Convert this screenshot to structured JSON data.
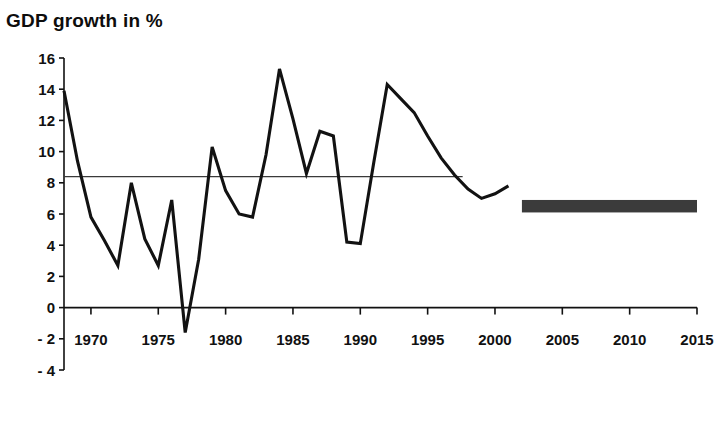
{
  "chart_data": {
    "type": "line",
    "title": "GDP growth in %",
    "xlabel": "",
    "ylabel": "",
    "xlim": [
      1968,
      2015
    ],
    "ylim": [
      -4,
      16
    ],
    "yticks": [
      -4,
      -2,
      0,
      2,
      4,
      6,
      8,
      10,
      12,
      14,
      16
    ],
    "ytick_labels": [
      "- 4",
      "- 2",
      "0",
      "2",
      "4",
      "6",
      "8",
      "10",
      "12",
      "14",
      "16"
    ],
    "xticks": [
      1970,
      1975,
      1980,
      1985,
      1990,
      1995,
      2000,
      2005,
      2010,
      2015
    ],
    "xtick_labels": [
      "1970",
      "1975",
      "1980",
      "1985",
      "1990",
      "1995",
      "2000",
      "2005",
      "2010",
      "2015"
    ],
    "grid": false,
    "legend": "none",
    "series": [
      {
        "name": "GDP growth",
        "color": "#121212",
        "x": [
          1968,
          1969,
          1970,
          1971,
          1972,
          1973,
          1974,
          1975,
          1976,
          1977,
          1978,
          1979,
          1980,
          1981,
          1982,
          1983,
          1984,
          1985,
          1986,
          1987,
          1988,
          1989,
          1990,
          1991,
          1992,
          1993,
          1994,
          1995,
          1996,
          1997,
          1998,
          1999,
          2000,
          2001
        ],
        "values": [
          13.9,
          9.4,
          5.8,
          4.3,
          2.7,
          8.0,
          4.4,
          2.7,
          6.9,
          -1.6,
          3.1,
          10.3,
          7.5,
          6.0,
          5.8,
          9.8,
          15.3,
          12.1,
          8.6,
          11.3,
          11.0,
          4.2,
          4.1,
          9.3,
          14.3,
          13.4,
          12.5,
          11.0,
          9.6,
          8.5,
          7.6,
          7.0,
          7.3,
          7.8
        ]
      }
    ],
    "reference_line": {
      "name": "average-line",
      "value": 8.4,
      "x_start": 1968,
      "x_end": 1997.6,
      "color": "#3a3a3a"
    },
    "forecast_band": {
      "name": "forecast-band",
      "label": "",
      "x_start": 2002.0,
      "x_end": 2015.0,
      "y_low": 6.1,
      "y_high": 6.9,
      "color": "#3b3b3b"
    }
  }
}
